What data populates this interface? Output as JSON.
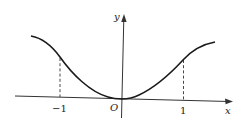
{
  "diagram": {
    "type": "function-graph",
    "axes": {
      "x_label": "x",
      "y_label": "y",
      "origin_label": "O"
    },
    "ticks": {
      "neg_one": "−1",
      "pos_one": "1"
    },
    "curve": {
      "description": "even function, minimum 0 at origin, inflection points at x = ±1, increasing toward a horizontal asymptote",
      "color": "#1a1a1a"
    },
    "guides": [
      {
        "x": -1,
        "style": "dashed"
      },
      {
        "x": 1,
        "style": "dashed"
      }
    ]
  }
}
